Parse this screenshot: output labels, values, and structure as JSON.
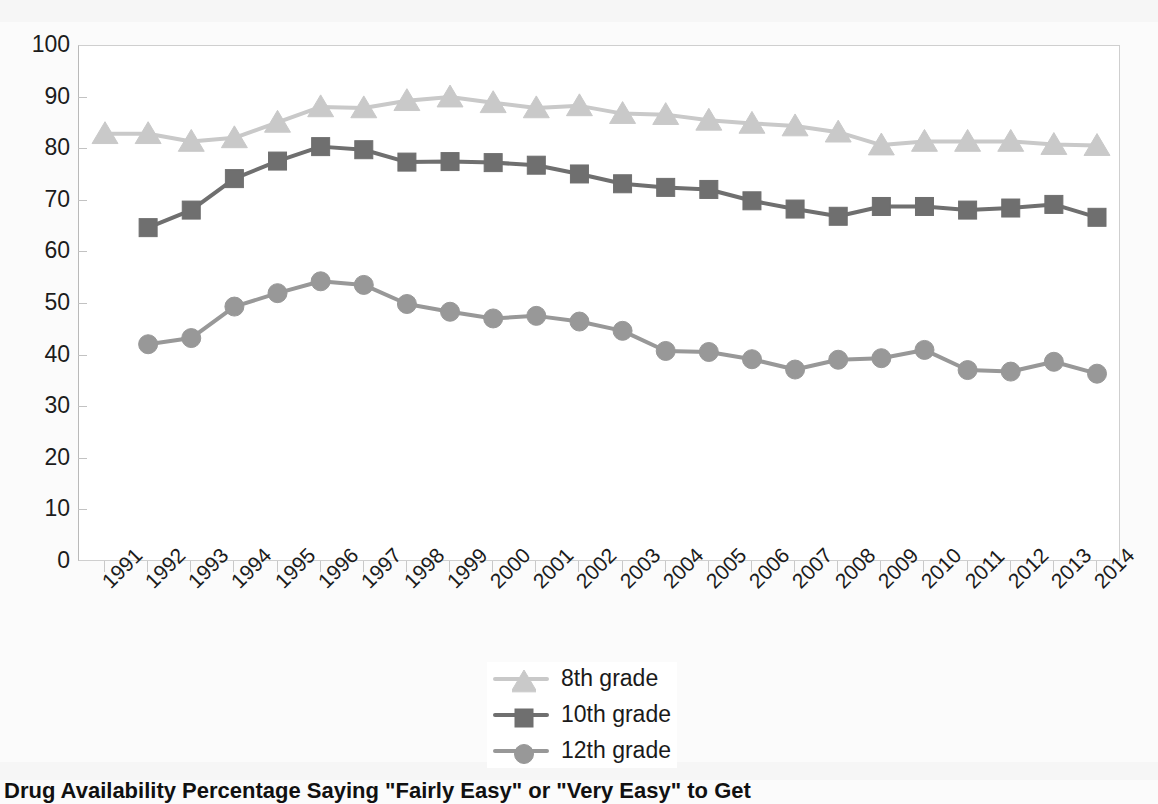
{
  "figure": {
    "caption": "Drug Availability Percentage Saying \"Fairly Easy\" or \"Very Easy\" to Get",
    "background_color": "#fbfbfb"
  },
  "axes": {
    "y": {
      "label": "",
      "min": 0,
      "max": 100,
      "step": 10,
      "ticks": [
        "100",
        "90",
        "80",
        "70",
        "60",
        "50",
        "40",
        "30",
        "20",
        "10",
        "0"
      ]
    },
    "x": {
      "label": "",
      "ticks": [
        "1991",
        "1992",
        "1993",
        "1994",
        "1995",
        "1996",
        "1997",
        "1998",
        "1999",
        "2000",
        "2001",
        "2002",
        "2003",
        "2004",
        "2005",
        "2006",
        "2007",
        "2008",
        "2009",
        "2010",
        "2011",
        "2012",
        "2013",
        "2014"
      ]
    }
  },
  "legend": {
    "position": "bottom-center",
    "items": [
      {
        "label": "8th grade",
        "marker": "triangle-marker",
        "color": "#c9c9c9"
      },
      {
        "label": "10th grade",
        "marker": "square-marker",
        "color": "#6f6f6f"
      },
      {
        "label": "12th grade",
        "marker": "circle-marker",
        "color": "#989898"
      }
    ]
  },
  "chart_data": {
    "type": "line",
    "title": "",
    "subtitle": "",
    "xlabel": "",
    "ylabel": "",
    "xlim": [
      1991,
      2014
    ],
    "ylim": [
      0,
      100
    ],
    "grid": false,
    "legend_position": "bottom-center",
    "x": [
      1991,
      1992,
      1993,
      1994,
      1995,
      1996,
      1997,
      1998,
      1999,
      2000,
      2001,
      2002,
      2003,
      2004,
      2005,
      2006,
      2007,
      2008,
      2009,
      2010,
      2011,
      2012,
      2013,
      2014
    ],
    "categories": [
      "1991",
      "1992",
      "1993",
      "1994",
      "1995",
      "1996",
      "1997",
      "1998",
      "1999",
      "2000",
      "2001",
      "2002",
      "2003",
      "2004",
      "2005",
      "2006",
      "2007",
      "2008",
      "2009",
      "2010",
      "2011",
      "2012",
      "2013",
      "2014"
    ],
    "series": [
      {
        "name": "8th grade",
        "color": "#c9c9c9",
        "marker": "triangle",
        "values": [
          83.0,
          83.0,
          81.5,
          82.2,
          85.2,
          88.2,
          88.0,
          89.4,
          90.1,
          89.0,
          88.0,
          88.4,
          86.9,
          86.7,
          85.6,
          85.0,
          84.5,
          83.3,
          80.8,
          81.5,
          81.5,
          81.5,
          80.9,
          80.7
        ]
      },
      {
        "name": "10th grade",
        "color": "#6f6f6f",
        "marker": "square",
        "values": [
          null,
          64.8,
          68.2,
          74.3,
          77.7,
          80.5,
          79.9,
          77.5,
          77.6,
          77.4,
          76.9,
          75.2,
          73.3,
          72.6,
          72.2,
          70.0,
          68.4,
          67.0,
          68.9,
          68.9,
          68.2,
          68.6,
          69.3,
          66.8
        ]
      },
      {
        "name": "12th grade",
        "color": "#989898",
        "marker": "circle",
        "values": [
          null,
          42.2,
          43.4,
          49.5,
          52.1,
          54.4,
          53.7,
          50.0,
          48.5,
          47.2,
          47.7,
          46.6,
          44.8,
          40.9,
          40.7,
          39.3,
          37.3,
          39.2,
          39.5,
          41.1,
          37.2,
          36.9,
          38.8,
          36.5
        ]
      }
    ]
  }
}
